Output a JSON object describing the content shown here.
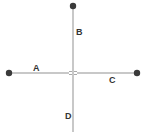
{
  "diagram": {
    "type": "crossing-lines",
    "line_color": "#c8c8c8",
    "node_color": "#3a3a3a",
    "label_color": "#333333",
    "nodes": [
      {
        "id": "top",
        "x": 73,
        "y": 6
      },
      {
        "id": "left",
        "x": 9,
        "y": 73
      },
      {
        "id": "right",
        "x": 137,
        "y": 73
      }
    ],
    "labels": {
      "a": "A",
      "b": "B",
      "c": "C",
      "d": "D"
    },
    "crossing": {
      "x": 73,
      "y": 73,
      "style": "line-hop"
    }
  }
}
